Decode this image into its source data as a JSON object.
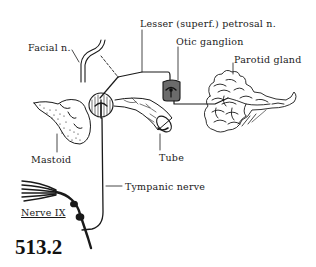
{
  "figure": {
    "number": "513.2",
    "labels": {
      "facial_nerve": "Facial n.",
      "lesser_petrosal": "Lesser (superf.) petrosal n.",
      "otic_ganglion": "Otic ganglion",
      "parotid_gland": "Parotid gland",
      "mastoid": "Mastoid",
      "tube": "Tube",
      "tympanic_nerve": "Tympanic nerve",
      "nerve_ix": "Nerve IX"
    },
    "artist_signature": "DC"
  },
  "colors": {
    "ink": "#1a1a1a",
    "ganglion_fill": "#6b6b6b",
    "background": "#ffffff"
  }
}
